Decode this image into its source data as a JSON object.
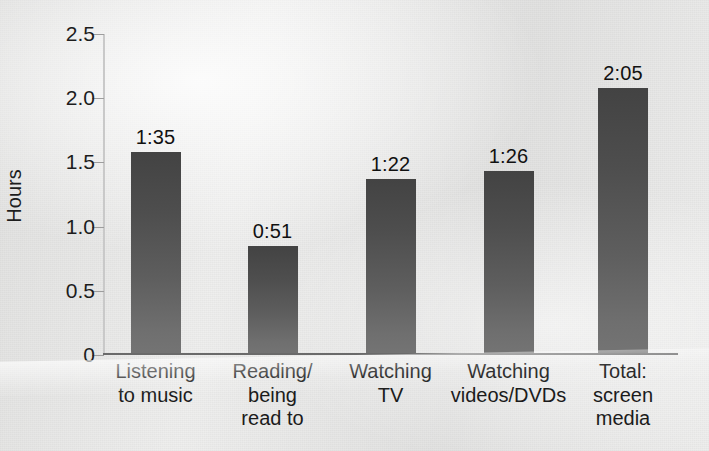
{
  "chart_data": {
    "type": "bar",
    "title": "",
    "xlabel": "",
    "ylabel": "Hours",
    "ylim": [
      0,
      2.5
    ],
    "yticks": [
      "0",
      "0.5",
      "1.0",
      "1.5",
      "2.0",
      "2.5"
    ],
    "ytick_values": [
      0,
      0.5,
      1.0,
      1.5,
      2.0,
      2.5
    ],
    "grid": "horizontal",
    "legend": "none",
    "categories": [
      "Listening\nto music",
      "Reading/\nbeing\nread to",
      "Watching\nTV",
      "Watching\nvideos/DVDs",
      "Total:\nscreen\nmedia"
    ],
    "values": [
      1.583,
      0.85,
      1.367,
      1.433,
      2.083
    ],
    "data_labels": [
      "1:35",
      "0:51",
      "1:22",
      "1:26",
      "2:05"
    ],
    "bar_color": "#4f4f4f",
    "gridline_color": "#9d9d9d",
    "axis_color": "#6a6a6a",
    "background_color": "#ececeb",
    "text_color": "#1d1d1d"
  }
}
